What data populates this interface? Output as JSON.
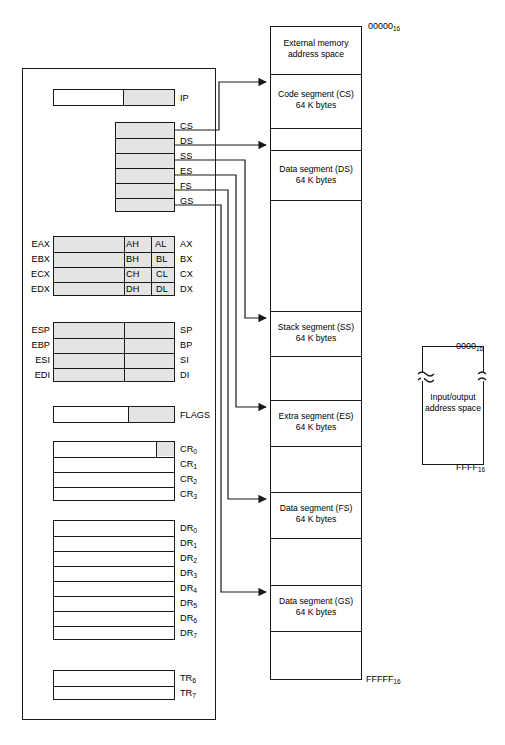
{
  "cpu": {
    "instruction_pointer": {
      "label": "IP"
    },
    "segment_registers": [
      {
        "label": "CS"
      },
      {
        "label": "DS"
      },
      {
        "label": "SS"
      },
      {
        "label": "ES"
      },
      {
        "label": "FS"
      },
      {
        "label": "GS"
      }
    ],
    "general_registers": [
      {
        "extended": "EAX",
        "high": "AH",
        "low": "AL",
        "word": "AX"
      },
      {
        "extended": "EBX",
        "high": "BH",
        "low": "BL",
        "word": "BX"
      },
      {
        "extended": "ECX",
        "high": "CH",
        "low": "CL",
        "word": "CX"
      },
      {
        "extended": "EDX",
        "high": "DH",
        "low": "DL",
        "word": "DX"
      }
    ],
    "pointer_index_registers": [
      {
        "extended": "ESP",
        "word": "SP"
      },
      {
        "extended": "EBP",
        "word": "BP"
      },
      {
        "extended": "ESI",
        "word": "SI"
      },
      {
        "extended": "EDI",
        "word": "DI"
      }
    ],
    "flags_register": {
      "label": "FLAGS"
    },
    "control_registers": [
      {
        "base": "CR",
        "index": "0"
      },
      {
        "base": "CR",
        "index": "1"
      },
      {
        "base": "CR",
        "index": "2"
      },
      {
        "base": "CR",
        "index": "3"
      }
    ],
    "debug_registers": [
      {
        "base": "DR",
        "index": "0"
      },
      {
        "base": "DR",
        "index": "1"
      },
      {
        "base": "DR",
        "index": "2"
      },
      {
        "base": "DR",
        "index": "3"
      },
      {
        "base": "DR",
        "index": "4"
      },
      {
        "base": "DR",
        "index": "5"
      },
      {
        "base": "DR",
        "index": "6"
      },
      {
        "base": "DR",
        "index": "7"
      }
    ],
    "test_registers": [
      {
        "base": "TR",
        "index": "6"
      },
      {
        "base": "TR",
        "index": "7"
      }
    ]
  },
  "memory_map": {
    "top_address": "00000",
    "top_address_sub": "16",
    "bottom_address": "FFFFF",
    "bottom_address_sub": "16",
    "segments": [
      {
        "name": "external-memory",
        "text": "External memory\naddress space"
      },
      {
        "name": "code-segment",
        "text": "Code segment (CS)\n64 K bytes"
      },
      {
        "name": "gap-1",
        "text": ""
      },
      {
        "name": "data-segment-ds",
        "text": "Data segment (DS)\n64 K bytes"
      },
      {
        "name": "gap-2",
        "text": ""
      },
      {
        "name": "stack-segment",
        "text": "Stack segment (SS)\n64 K bytes"
      },
      {
        "name": "gap-3",
        "text": ""
      },
      {
        "name": "extra-segment",
        "text": "Extra segment (ES)\n64 K bytes"
      },
      {
        "name": "gap-4",
        "text": ""
      },
      {
        "name": "data-segment-fs",
        "text": "Data segment (FS)\n64 K bytes"
      },
      {
        "name": "gap-5",
        "text": ""
      },
      {
        "name": "data-segment-gs",
        "text": "Data segment (GS)\n64 K bytes"
      },
      {
        "name": "gap-6",
        "text": ""
      }
    ]
  },
  "io_space": {
    "text": "Input/output\naddress space",
    "top_address": "0000",
    "top_address_sub": "16",
    "bottom_address": "FFFF",
    "bottom_address_sub": "16",
    "break_symbol": "break-icon"
  },
  "colors": {
    "line": "#1a1a1a",
    "shade": "#e4e4e4",
    "background": "#ffffff"
  }
}
